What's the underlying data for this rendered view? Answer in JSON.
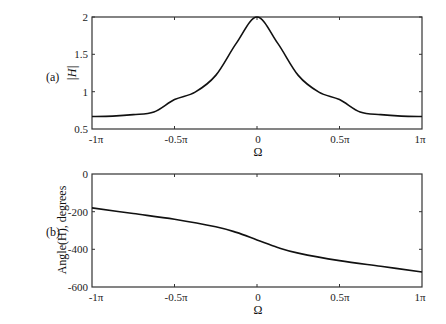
{
  "chart_data": [
    {
      "type": "line",
      "panel_label": "(a)",
      "title": "",
      "xlabel": "Ω",
      "ylabel": "|H|",
      "xlim": [
        -3.14159,
        3.14159
      ],
      "ylim": [
        0.5,
        2
      ],
      "xticks": [
        "-1π",
        "-0.5π",
        "0",
        "0.5π",
        "1π"
      ],
      "yticks": [
        "0.5",
        "1",
        "1.5",
        "2"
      ],
      "grid": false,
      "series": [
        {
          "name": "|H|",
          "x": [
            -1.0,
            -0.875,
            -0.75,
            -0.625,
            -0.5,
            -0.375,
            -0.25,
            -0.125,
            0.0,
            0.125,
            0.25,
            0.375,
            0.5,
            0.625,
            0.75,
            0.875,
            1.0
          ],
          "x_unit": "π",
          "values": [
            0.667,
            0.673,
            0.692,
            0.727,
            0.894,
            0.994,
            1.218,
            1.65,
            2.0,
            1.65,
            1.218,
            0.994,
            0.894,
            0.727,
            0.692,
            0.673,
            0.667
          ]
        }
      ]
    },
    {
      "type": "line",
      "panel_label": "(b)",
      "title": "",
      "xlabel": "Ω",
      "ylabel": "Angle(H), degrees",
      "xlim": [
        -3.14159,
        3.14159
      ],
      "ylim": [
        -600,
        0
      ],
      "xticks": [
        "-1π",
        "-0.5π",
        "0",
        "0.5π",
        "1π"
      ],
      "yticks": [
        "0",
        "-200",
        "-400",
        "-600"
      ],
      "grid": false,
      "series": [
        {
          "name": "Angle(H)",
          "x": [
            -1.0,
            -0.75,
            -0.5,
            -0.25,
            -0.125,
            0.0,
            0.125,
            0.25,
            0.5,
            0.75,
            1.0
          ],
          "x_unit": "π",
          "values": [
            -180,
            -210,
            -240,
            -280,
            -310,
            -350,
            -390,
            -420,
            -460,
            -490,
            -520
          ]
        }
      ]
    }
  ],
  "labels": {
    "panel_a": "(a)",
    "panel_b": "(b)",
    "top_ylabel": "|H|",
    "bottom_ylabel": "Angle(H), degrees",
    "xlabel": "Ω",
    "xticks": [
      "-1π",
      "-0.5π",
      "0",
      "0.5π",
      "1π"
    ],
    "top_yticks": [
      "2",
      "1.5",
      "1",
      "0.5"
    ],
    "bottom_yticks": [
      "0",
      "-200",
      "-400",
      "-600"
    ]
  }
}
